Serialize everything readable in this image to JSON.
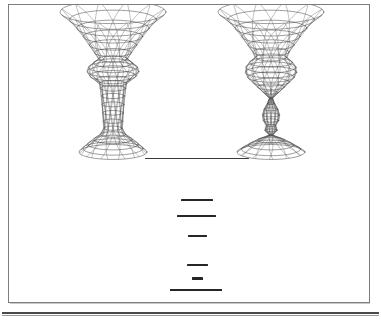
{
  "document": {
    "kind": "scanned-figure-page",
    "background_color": "#ffffff",
    "frame_color": "#7d7d7d",
    "ink_color": "#2b2b2b",
    "page_width": 381,
    "page_height": 320
  },
  "figure": {
    "name": "two-hyperboloid-wireframe-towers",
    "stroke_color": "#2b2b2b",
    "items": [
      {
        "id": "left-structure",
        "label": "left hyperboloid tower",
        "center_x": 113,
        "top_y": 12,
        "bottom_y": 152,
        "top_radius": 53,
        "waist_radius": 12,
        "bulge_radius": 26,
        "base_radius": 34,
        "profile": "flared funnel top, single bulged waist, straight shaft, flared skirt base",
        "rings": 16,
        "meridians": 12
      },
      {
        "id": "right-structure",
        "label": "right hyperboloid tower",
        "center_x": 271,
        "top_y": 12,
        "bottom_y": 152,
        "top_radius": 53,
        "waist_radius": 1,
        "bulge_radius": 26,
        "base_radius": 34,
        "profile": "flared funnel top, bulged body pinching to a point, small teardrop bulb, flared skirt base",
        "rings": 18,
        "meridians": 12
      }
    ]
  },
  "caption": {
    "name": "redacted-caption",
    "note": "caption text is illegible / blacked out in the scan",
    "bars": [
      {
        "id": "rule",
        "x": 145,
        "y": 158,
        "width": 104,
        "height": 1.4,
        "tone": "soft"
      },
      {
        "id": "line-1",
        "x": 181,
        "y": 199,
        "width": 32,
        "height": 2.2,
        "tone": "dark"
      },
      {
        "id": "line-2",
        "x": 177,
        "y": 215,
        "width": 39,
        "height": 2.0,
        "tone": "dark"
      },
      {
        "id": "line-3",
        "x": 188,
        "y": 235,
        "width": 19,
        "height": 2.0,
        "tone": "dark"
      },
      {
        "id": "line-4",
        "x": 187,
        "y": 264,
        "width": 21,
        "height": 2.2,
        "tone": "dark"
      },
      {
        "id": "line-5",
        "x": 192,
        "y": 277,
        "width": 11,
        "height": 3.0,
        "tone": "dark"
      },
      {
        "id": "line-6",
        "x": 170,
        "y": 289,
        "width": 52,
        "height": 2.0,
        "tone": "dark"
      }
    ]
  }
}
